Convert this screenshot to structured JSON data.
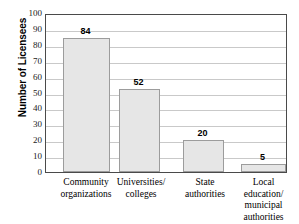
{
  "chart_data": {
    "type": "bar",
    "title": "",
    "xlabel": "",
    "ylabel": "Number of Licensees",
    "categories": [
      "Community organizations",
      "Universities/ colleges",
      "State authorities",
      "Local education/ municipal authorities"
    ],
    "category_lines": [
      [
        "Community",
        "organizations"
      ],
      [
        "Universities/",
        "colleges"
      ],
      [
        "State",
        "authorities"
      ],
      [
        "Local",
        "education/",
        "municipal",
        "authorities"
      ]
    ],
    "values": [
      84,
      52,
      20,
      5
    ],
    "value_labels": [
      "84",
      "52",
      "20",
      "5"
    ],
    "ylim": [
      0,
      100
    ],
    "ytick_step": 10,
    "ytick_labels": [
      "100",
      "90",
      "80",
      "70",
      "60",
      "50",
      "40",
      "30",
      "20",
      "10",
      "0"
    ],
    "grid": true,
    "legend": "none",
    "colors": {
      "bar_fill": "#e6e6e6",
      "bar_border": "#9c9c9c",
      "gridline": "#c9c9c9",
      "frame": "#4a4a4a",
      "text": "#000000",
      "background": "#ffffff"
    }
  }
}
